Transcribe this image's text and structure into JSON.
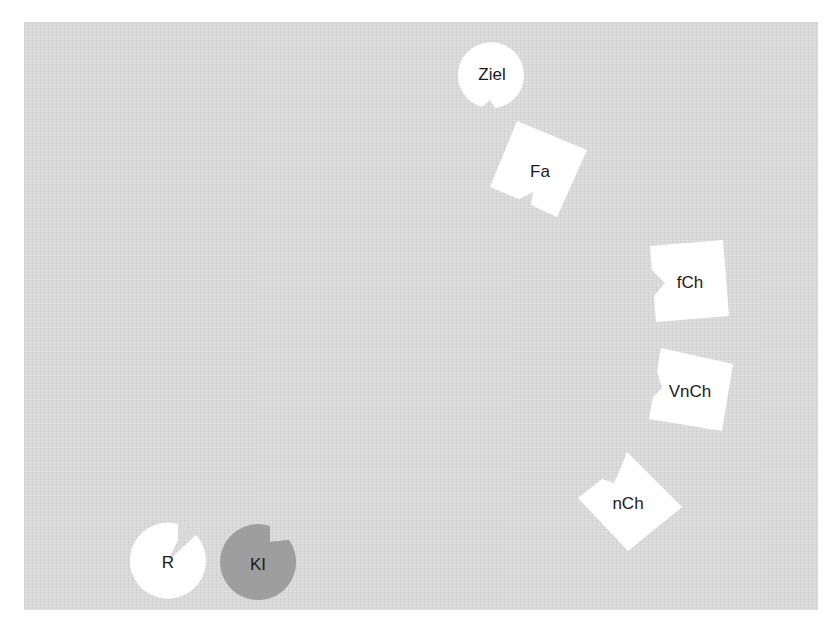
{
  "board": {
    "background": "#d9d9d9"
  },
  "pieces": [
    {
      "id": "ziel",
      "label": "Ziel",
      "shape": "circle",
      "fill": "#ffffff"
    },
    {
      "id": "fa",
      "label": "Fa",
      "shape": "square",
      "fill": "#ffffff"
    },
    {
      "id": "fch",
      "label": "fCh",
      "shape": "square",
      "fill": "#ffffff"
    },
    {
      "id": "vnch",
      "label": "VnCh",
      "shape": "square",
      "fill": "#ffffff"
    },
    {
      "id": "nch",
      "label": "nCh",
      "shape": "square",
      "fill": "#ffffff"
    },
    {
      "id": "r",
      "label": "R",
      "shape": "circle",
      "fill": "#ffffff"
    },
    {
      "id": "ki",
      "label": "KI",
      "shape": "circle",
      "fill": "#9e9e9e"
    }
  ]
}
